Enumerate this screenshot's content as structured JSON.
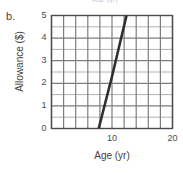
{
  "figure": {
    "part_label": "b.",
    "clipped_header": "Age (yr)"
  },
  "chart_data": {
    "type": "line",
    "title": "",
    "xlabel": "Age (yr)",
    "ylabel": "Allowance ($)",
    "xlim": [
      0,
      20
    ],
    "ylim": [
      0,
      5
    ],
    "grid": true,
    "legend": "none",
    "x_ticks": [
      {
        "value": 0,
        "label": ""
      },
      {
        "value": 2,
        "label": ""
      },
      {
        "value": 4,
        "label": ""
      },
      {
        "value": 6,
        "label": ""
      },
      {
        "value": 8,
        "label": ""
      },
      {
        "value": 10,
        "label": "10"
      },
      {
        "value": 12,
        "label": ""
      },
      {
        "value": 14,
        "label": ""
      },
      {
        "value": 16,
        "label": ""
      },
      {
        "value": 18,
        "label": ""
      },
      {
        "value": 20,
        "label": "20"
      }
    ],
    "x_tick_labels_shown": [
      "10",
      "20"
    ],
    "y_ticks": [
      {
        "value": 0,
        "label": "0"
      },
      {
        "value": 1,
        "label": "1"
      },
      {
        "value": 2,
        "label": "2"
      },
      {
        "value": 3,
        "label": "3"
      },
      {
        "value": 4,
        "label": "4"
      },
      {
        "value": 5,
        "label": "5"
      }
    ],
    "y_tick_labels_shown": [
      "5",
      "4",
      "3",
      "2",
      "1",
      "0"
    ],
    "x_minor_step": 2,
    "y_minor_step": 0.5,
    "series": [
      {
        "name": "Allowance vs Age",
        "color": "#2f2f2f",
        "points": [
          {
            "x": 7.8,
            "y": 0
          },
          {
            "x": 10.0,
            "y": 2.3
          },
          {
            "x": 12.4,
            "y": 5.0
          }
        ]
      }
    ]
  },
  "colors": {
    "line": "#2f2f2f",
    "grid_major": "#7d7d7d",
    "grid_minor": "#a9a9a9",
    "axis": "#4a4a4a",
    "text": "#3f3f3f",
    "background": "#ffffff"
  }
}
